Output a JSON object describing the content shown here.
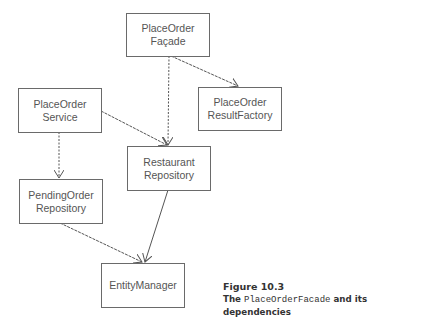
{
  "diagram": {
    "nodes": [
      {
        "id": "facade",
        "line1": "PlaceOrder",
        "line2": "Façade"
      },
      {
        "id": "result_factory",
        "line1": "PlaceOrder",
        "line2": "ResultFactory"
      },
      {
        "id": "service",
        "line1": "PlaceOrder",
        "line2": "Service"
      },
      {
        "id": "restaurant_repo",
        "line1": "Restaurant",
        "line2": "Repository"
      },
      {
        "id": "pending_order_repo",
        "line1": "PendingOrder",
        "line2": "Repository"
      },
      {
        "id": "entity_manager",
        "line1": "EntityManager",
        "line2": ""
      }
    ],
    "edges": [
      {
        "from": "facade",
        "to": "restaurant_repo",
        "style": "dashed"
      },
      {
        "from": "facade",
        "to": "result_factory",
        "style": "dashed"
      },
      {
        "from": "service",
        "to": "restaurant_repo",
        "style": "dashed"
      },
      {
        "from": "service",
        "to": "pending_order_repo",
        "style": "dashed"
      },
      {
        "from": "pending_order_repo",
        "to": "entity_manager",
        "style": "dashed"
      },
      {
        "from": "restaurant_repo",
        "to": "entity_manager",
        "style": "solid"
      }
    ],
    "colors": {
      "line": "#555555",
      "box_border": "#6a6a6a",
      "text": "#555555"
    }
  },
  "caption": {
    "figure_label": "Figure 10.3",
    "prefix": "The ",
    "code": "PlaceOrderFacade",
    "suffix": " and its dependencies"
  }
}
